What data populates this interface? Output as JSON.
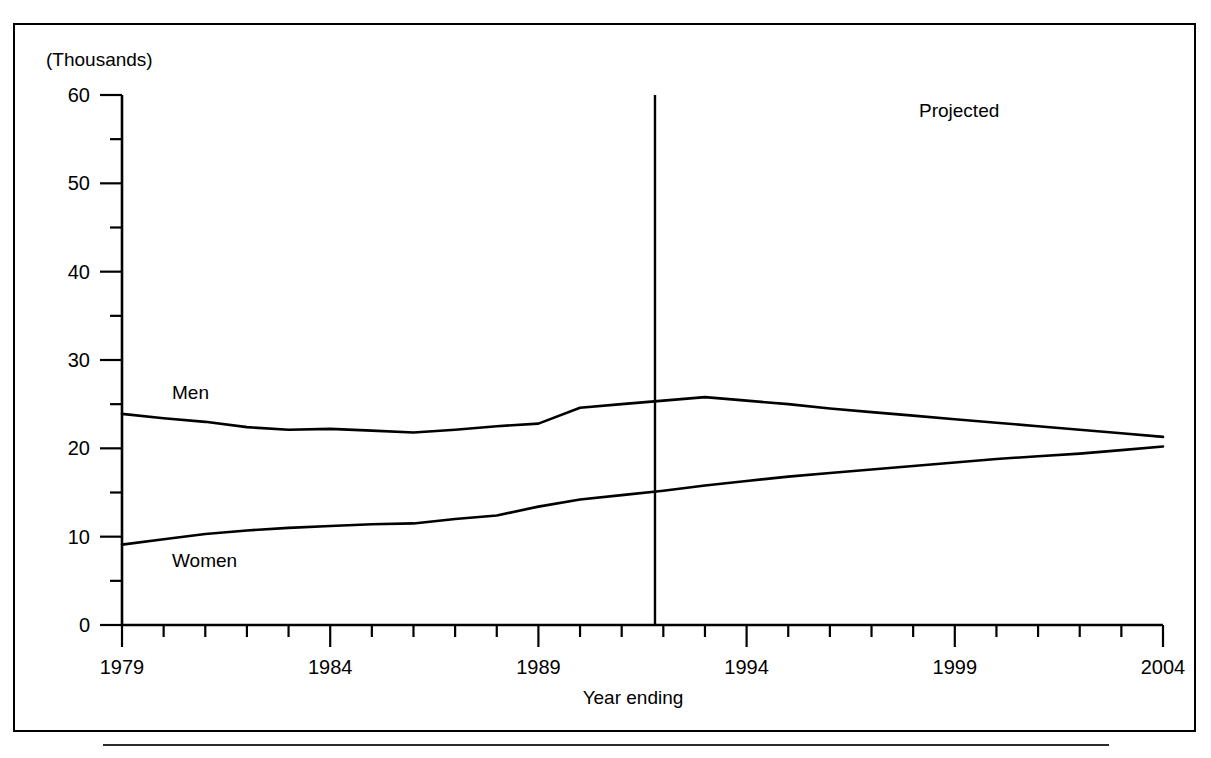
{
  "chart_data": {
    "type": "line",
    "title": "",
    "subtitle": "",
    "units_label": "(Thousands)",
    "xlabel": "Year ending",
    "ylabel": "",
    "xlim": [
      1979,
      2004
    ],
    "ylim": [
      0,
      60
    ],
    "grid": false,
    "legend_position": "inline-annotations",
    "y_major_ticks": [
      0,
      10,
      20,
      30,
      40,
      50,
      60
    ],
    "y_minor_ticks": [
      5,
      15,
      25,
      35,
      45,
      55
    ],
    "y_tick_labels": [
      "0",
      "10",
      "20",
      "30",
      "40",
      "50",
      "60"
    ],
    "x_major_ticks": [
      1979,
      1984,
      1989,
      1994,
      1999,
      2004
    ],
    "x_tick_labels": [
      "1979",
      "1984",
      "1989",
      "1994",
      "1999",
      "2004"
    ],
    "x_minor_ticks": [
      1980,
      1981,
      1982,
      1983,
      1985,
      1986,
      1987,
      1988,
      1990,
      1991,
      1992,
      1993,
      1995,
      1996,
      1997,
      1998,
      2000,
      2001,
      2002,
      2003
    ],
    "annotations": [
      {
        "text": "Projected",
        "x": 1998.2,
        "y": 57.0
      },
      {
        "text": "Men",
        "x": 1980.2,
        "y": 27.4
      },
      {
        "text": "Women",
        "x": 1980.2,
        "y": 8.2
      }
    ],
    "divider_line": {
      "x": 1991.8,
      "y_from": 0,
      "y_to": 60,
      "label": "projected-divider"
    },
    "x": [
      1979,
      1980,
      1981,
      1982,
      1983,
      1984,
      1985,
      1986,
      1987,
      1988,
      1989,
      1990,
      1991,
      1992,
      1993,
      1994,
      1995,
      1996,
      1997,
      1998,
      1999,
      2000,
      2001,
      2002,
      2003,
      2004
    ],
    "series": [
      {
        "name": "Men",
        "color": "#000000",
        "values": [
          23.9,
          23.4,
          23.0,
          22.4,
          22.1,
          22.2,
          22.0,
          21.8,
          22.1,
          22.5,
          22.8,
          24.6,
          25.0,
          25.4,
          25.8,
          25.4,
          25.0,
          24.5,
          24.1,
          23.7,
          23.3,
          22.9,
          22.5,
          22.1,
          21.7,
          21.3
        ]
      },
      {
        "name": "Women",
        "color": "#000000",
        "values": [
          9.1,
          9.7,
          10.3,
          10.7,
          11.0,
          11.2,
          11.4,
          11.5,
          12.0,
          12.4,
          13.4,
          14.2,
          14.7,
          15.2,
          15.8,
          16.3,
          16.8,
          17.2,
          17.6,
          18.0,
          18.4,
          18.8,
          19.1,
          19.4,
          19.8,
          20.2
        ]
      }
    ]
  },
  "figure": {
    "units_label": "(Thousands)",
    "xlabel": "Year ending",
    "projected_label": "Projected",
    "men_label": "Men",
    "women_label": "Women"
  },
  "colors": {
    "line": "#000000",
    "frame": "#000000",
    "background": "#ffffff"
  }
}
